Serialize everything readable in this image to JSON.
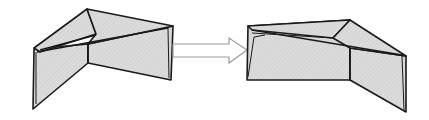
{
  "diagram": {
    "colors": {
      "fill": "#d9d9d9",
      "stroke": "#1a1a1a",
      "arrow_stroke": "#9a9a9a",
      "background": "#ffffff"
    },
    "figures": [
      {
        "name": "before-fold-state"
      },
      {
        "name": "after-fold-state"
      }
    ],
    "arrow": {
      "direction": "right"
    }
  }
}
